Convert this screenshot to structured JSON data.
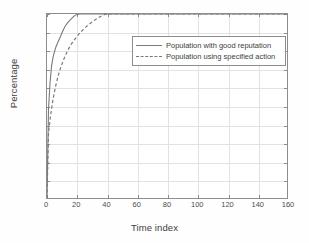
{
  "chart_data": {
    "type": "line",
    "title": "",
    "xlabel": "Time index",
    "ylabel": "Percentage",
    "xlim": [
      0,
      160
    ],
    "ylim": [
      0.5,
      1.0
    ],
    "xticks": [
      "0",
      "20",
      "40",
      "60",
      "80",
      "100",
      "120",
      "140",
      "160"
    ],
    "yticks": [
      "0.5",
      "0.55",
      "0.6",
      "0.65",
      "0.7",
      "0.75",
      "0.8",
      "0.85",
      "0.9",
      "0.95",
      "1"
    ],
    "grid": true,
    "legend_position": "upper right",
    "line_color": "#7a7a7a",
    "series": [
      {
        "name": "Population with good reputation",
        "style": "solid",
        "x": [
          0,
          1,
          2,
          3,
          4,
          5,
          6,
          7,
          8,
          9,
          10,
          11,
          12,
          13,
          14,
          15,
          16,
          17,
          18,
          19,
          20,
          22,
          25,
          30,
          40,
          60,
          80,
          100,
          120,
          140,
          160
        ],
        "y": [
          0.5,
          0.742,
          0.812,
          0.857,
          0.882,
          0.898,
          0.911,
          0.921,
          0.93,
          0.939,
          0.949,
          0.958,
          0.966,
          0.972,
          0.977,
          0.982,
          0.986,
          0.99,
          0.994,
          0.997,
          0.999,
          1.0,
          1.0,
          1.0,
          1.0,
          1.0,
          1.0,
          1.0,
          1.0,
          1.0,
          1.0
        ]
      },
      {
        "name": "Population using specified action",
        "style": "dashed",
        "x": [
          0,
          1,
          2,
          3,
          4,
          5,
          6,
          7,
          8,
          9,
          10,
          11,
          12,
          13,
          14,
          15,
          16,
          17,
          18,
          19,
          20,
          21,
          22,
          24,
          26,
          28,
          30,
          32,
          34,
          36,
          38,
          40,
          60,
          80,
          100,
          120,
          140,
          160
        ],
        "y": [
          0.5,
          0.676,
          0.712,
          0.742,
          0.768,
          0.789,
          0.808,
          0.825,
          0.84,
          0.853,
          0.864,
          0.875,
          0.885,
          0.894,
          0.902,
          0.91,
          0.917,
          0.923,
          0.929,
          0.934,
          0.939,
          0.944,
          0.949,
          0.957,
          0.965,
          0.972,
          0.978,
          0.984,
          0.989,
          0.994,
          0.998,
          1.0,
          1.0,
          1.0,
          1.0,
          1.0,
          1.0,
          1.0
        ]
      }
    ]
  },
  "legend": {
    "entries": [
      {
        "label": "Population with good reputation",
        "style": "solid"
      },
      {
        "label": "Population using specified action",
        "style": "dashed"
      }
    ]
  }
}
